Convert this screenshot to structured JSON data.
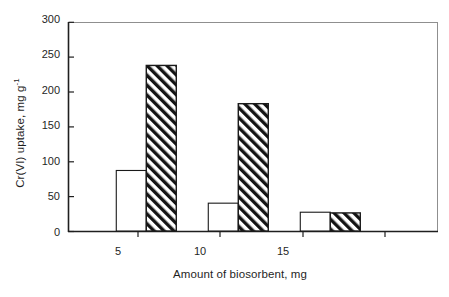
{
  "chart_data": {
    "type": "bar",
    "title": "",
    "subtitle": "",
    "xlabel": "Amount of biosorbent,  mg",
    "ylabel": "Cr(VI) uptake, mg g",
    "ylabel_superscript": "-1",
    "categories": [
      "5",
      "10",
      "15"
    ],
    "xtick_labels": [
      "5",
      "10",
      "15"
    ],
    "ytick_labels": [
      "0",
      "50",
      "100",
      "150",
      "200",
      "250",
      "300"
    ],
    "ytick_values": [
      0,
      50,
      100,
      150,
      200,
      250,
      300
    ],
    "ylim": [
      0,
      300
    ],
    "xlim": [
      0,
      4
    ],
    "grid": false,
    "legend": "none",
    "series": [
      {
        "name": "open-bar-series",
        "fill": "white",
        "pattern": "solid",
        "values": [
          87,
          40,
          27
        ]
      },
      {
        "name": "hatched-bar-series",
        "fill": "white",
        "pattern": "diagonal-hatch-forward",
        "values": [
          238,
          183,
          26
        ]
      }
    ],
    "colors": {
      "axis": "#1f1f1f",
      "frame": "#8a8a8a",
      "bar_outline": "#1a1a1a",
      "bar_open_fill": "#ffffff",
      "hatch_line": "#141414",
      "background": "#ffffff"
    },
    "annotations": []
  }
}
